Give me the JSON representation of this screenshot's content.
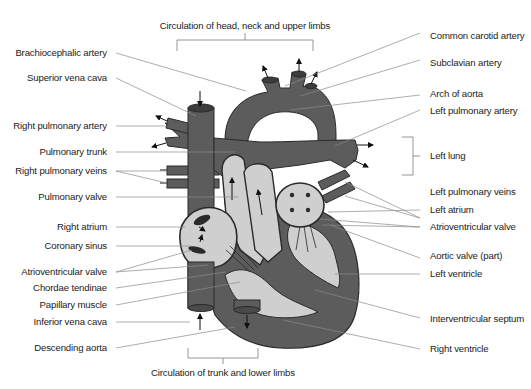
{
  "diagram": {
    "title": "",
    "colors": {
      "vessel": "#5c5c5c",
      "chamber_fill": "#cfcfcf",
      "outline": "#2a2a2a",
      "leader": "#8a8a8a",
      "text": "#222222",
      "background": "#ffffff"
    },
    "top_caption": "Circulation of head, neck and upper limbs",
    "bottom_caption": "Circulation of trunk and lower limbs",
    "left_labels": [
      {
        "id": "brachiocephalic-artery",
        "text": "Brachiocephalic artery"
      },
      {
        "id": "superior-vena-cava",
        "text": "Superior vena cava"
      },
      {
        "id": "right-pulmonary-artery",
        "text": "Right pulmonary artery"
      },
      {
        "id": "pulmonary-trunk",
        "text": "Pulmonary trunk"
      },
      {
        "id": "right-pulmonary-veins",
        "text": "Right pulmonary veins"
      },
      {
        "id": "pulmonary-valve",
        "text": "Pulmonary valve"
      },
      {
        "id": "right-atrium",
        "text": "Right atrium"
      },
      {
        "id": "coronary-sinus",
        "text": "Coronary sinus"
      },
      {
        "id": "atrioventricular-valve-right",
        "text": "Atrioventricular valve"
      },
      {
        "id": "chordae-tendinae",
        "text": "Chordae tendinae"
      },
      {
        "id": "papillary-muscle",
        "text": "Papillary muscle"
      },
      {
        "id": "inferior-vena-cava",
        "text": "Inferior vena cava"
      },
      {
        "id": "descending-aorta",
        "text": "Descending aorta"
      }
    ],
    "right_labels": [
      {
        "id": "common-carotid-artery",
        "text": "Common carotid artery"
      },
      {
        "id": "subclavian-artery",
        "text": "Subclavian artery"
      },
      {
        "id": "arch-of-aorta",
        "text": "Arch of aorta"
      },
      {
        "id": "left-pulmonary-artery",
        "text": "Left pulmonary artery"
      },
      {
        "id": "left-lung",
        "text": "Left lung"
      },
      {
        "id": "left-pulmonary-veins",
        "text": "Left pulmonary veins"
      },
      {
        "id": "left-atrium",
        "text": "Left atrium"
      },
      {
        "id": "atrioventricular-valve-left",
        "text": "Atrioventricular valve"
      },
      {
        "id": "aortic-valve-part",
        "text": "Aortic valve (part)"
      },
      {
        "id": "left-ventricle",
        "text": "Left ventricle"
      },
      {
        "id": "interventricular-septum",
        "text": "Interventricular septum"
      },
      {
        "id": "right-ventricle",
        "text": "Right ventricle"
      }
    ]
  }
}
